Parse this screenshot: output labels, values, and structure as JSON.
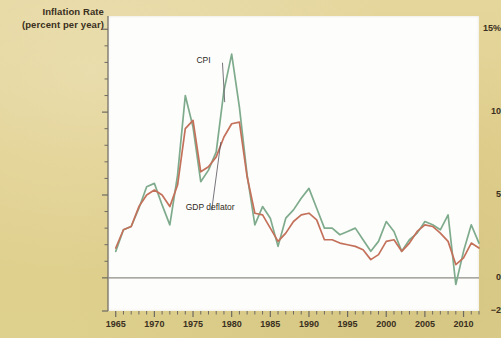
{
  "figure": {
    "background_color": "#e2d293",
    "plot_background": "#fdfdfb"
  },
  "chart_data": {
    "type": "line",
    "title": "",
    "ylabel_line1": "Inflation Rate",
    "ylabel_line2": "(percent per year)",
    "xlabel": "",
    "xlim": [
      1964,
      2012
    ],
    "ylim": [
      -2,
      15.8
    ],
    "grid": false,
    "legend": "inline-annotations",
    "y_ticks_major": [
      -2,
      0,
      5,
      10,
      15
    ],
    "y_tick_labels": [
      "−2",
      "0",
      "5",
      "10",
      "15%"
    ],
    "y_ticks_minor": [
      1,
      2,
      3,
      4,
      6,
      7,
      8,
      9,
      11,
      12,
      13,
      14
    ],
    "x_ticks_major": [
      1965,
      1970,
      1975,
      1980,
      1985,
      1990,
      1995,
      2000,
      2005,
      2010
    ],
    "x_tick_labels": [
      "1965",
      "1970",
      "1975",
      "1980",
      "1985",
      "1990",
      "1995",
      "2000",
      "2005",
      "2010"
    ],
    "x_tick_step_minor": 1,
    "annotations": [
      {
        "name": "cpi-label",
        "text": "CPI",
        "x": 1977.0,
        "y": 13.1,
        "point_x": 1979.1,
        "point_y": 10.6
      },
      {
        "name": "gdp-deflator-label",
        "text": "GDP deflator",
        "x": 1975.6,
        "y": 4.2,
        "point_x": 1978.6,
        "point_y": 8.2
      }
    ],
    "x": [
      1965,
      1966,
      1967,
      1968,
      1969,
      1970,
      1971,
      1972,
      1973,
      1974,
      1975,
      1976,
      1977,
      1978,
      1979,
      1980,
      1981,
      1982,
      1983,
      1984,
      1985,
      1986,
      1987,
      1988,
      1989,
      1990,
      1991,
      1992,
      1993,
      1994,
      1995,
      1996,
      1997,
      1998,
      1999,
      2000,
      2001,
      2002,
      2003,
      2004,
      2005,
      2006,
      2007,
      2008,
      2009,
      2010,
      2011,
      2012
    ],
    "series": [
      {
        "name": "CPI",
        "color": "#7fab8d",
        "values": [
          1.6,
          2.9,
          3.1,
          4.2,
          5.5,
          5.7,
          4.4,
          3.2,
          6.2,
          11.0,
          9.1,
          5.8,
          6.5,
          7.6,
          11.3,
          13.5,
          10.3,
          6.2,
          3.2,
          4.3,
          3.6,
          1.9,
          3.6,
          4.1,
          4.8,
          5.4,
          4.2,
          3.0,
          3.0,
          2.6,
          2.8,
          3.0,
          2.3,
          1.6,
          2.2,
          3.4,
          2.8,
          1.6,
          2.3,
          2.7,
          3.4,
          3.2,
          2.9,
          3.8,
          -0.4,
          1.6,
          3.2,
          2.1
        ]
      },
      {
        "name": "GDP deflator",
        "color": "#c4715b",
        "values": [
          1.8,
          2.9,
          3.1,
          4.3,
          5.0,
          5.3,
          5.0,
          4.3,
          5.6,
          9.0,
          9.5,
          6.4,
          6.7,
          7.3,
          8.5,
          9.3,
          9.4,
          6.1,
          3.9,
          3.8,
          3.0,
          2.2,
          2.7,
          3.4,
          3.8,
          3.9,
          3.5,
          2.3,
          2.3,
          2.1,
          2.0,
          1.9,
          1.7,
          1.1,
          1.4,
          2.2,
          2.3,
          1.6,
          2.1,
          2.8,
          3.2,
          3.1,
          2.7,
          2.2,
          0.8,
          1.2,
          2.1,
          1.8
        ]
      }
    ]
  }
}
